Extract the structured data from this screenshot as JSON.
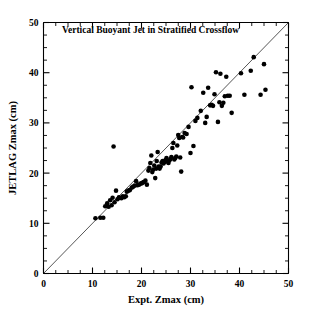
{
  "chart_data": {
    "type": "scatter",
    "title": "Vertical Buoyant Jet in Stratified Crossflow",
    "xlabel": "Expt. Zmax (cm)",
    "ylabel": "JETLAG Zmax (cm)",
    "xlim": [
      0,
      50
    ],
    "ylim": [
      0,
      50
    ],
    "xticks": [
      0,
      10,
      20,
      30,
      40,
      50
    ],
    "yticks": [
      0,
      10,
      20,
      30,
      40,
      50
    ],
    "xtick_labels": [
      "0",
      "10",
      "20",
      "30",
      "40",
      "50"
    ],
    "ytick_labels": [
      "0",
      "10",
      "20",
      "30",
      "40",
      "50"
    ],
    "minor_tick_interval": 2.5,
    "grid": false,
    "legend": false,
    "marker": "filled-circle",
    "marker_color": "#000000",
    "marker_size_px": 4.6,
    "reference_line": {
      "name": "one-to-one line",
      "x": [
        0,
        50
      ],
      "y": [
        0,
        50
      ],
      "color": "#2b2b2b"
    },
    "points": [
      [
        10.6,
        11.0
      ],
      [
        11.6,
        11.1
      ],
      [
        12.2,
        11.1
      ],
      [
        12.6,
        13.4
      ],
      [
        13.0,
        14.0
      ],
      [
        13.3,
        13.3
      ],
      [
        13.6,
        14.6
      ],
      [
        13.9,
        13.6
      ],
      [
        14.1,
        15.1
      ],
      [
        14.3,
        25.3
      ],
      [
        14.5,
        14.2
      ],
      [
        14.8,
        16.5
      ],
      [
        15.1,
        14.8
      ],
      [
        15.4,
        15.2
      ],
      [
        15.6,
        15.1
      ],
      [
        15.9,
        15.0
      ],
      [
        16.2,
        15.4
      ],
      [
        16.5,
        15.2
      ],
      [
        16.8,
        15.4
      ],
      [
        17.0,
        16.3
      ],
      [
        17.3,
        16.5
      ],
      [
        17.6,
        16.6
      ],
      [
        18.0,
        17.1
      ],
      [
        18.3,
        17.3
      ],
      [
        18.6,
        17.5
      ],
      [
        18.9,
        18.4
      ],
      [
        19.2,
        17.6
      ],
      [
        19.5,
        17.7
      ],
      [
        19.8,
        17.9
      ],
      [
        20.1,
        18.0
      ],
      [
        20.4,
        18.2
      ],
      [
        20.8,
        18.5
      ],
      [
        21.1,
        17.7
      ],
      [
        21.4,
        20.5
      ],
      [
        21.6,
        21.0
      ],
      [
        21.8,
        22.0
      ],
      [
        22.0,
        23.5
      ],
      [
        22.2,
        20.2
      ],
      [
        22.4,
        20.7
      ],
      [
        22.6,
        21.5
      ],
      [
        22.8,
        19.0
      ],
      [
        23.0,
        20.9
      ],
      [
        23.1,
        22.4
      ],
      [
        23.3,
        24.2
      ],
      [
        23.5,
        21.3
      ],
      [
        23.7,
        20.9
      ],
      [
        23.9,
        21.3
      ],
      [
        24.1,
        22.1
      ],
      [
        24.3,
        22.4
      ],
      [
        24.5,
        21.9
      ],
      [
        24.7,
        22.2
      ],
      [
        24.9,
        22.6
      ],
      [
        25.1,
        23.0
      ],
      [
        25.3,
        22.3
      ],
      [
        25.5,
        22.0
      ],
      [
        25.7,
        22.5
      ],
      [
        25.9,
        22.8
      ],
      [
        26.1,
        23.2
      ],
      [
        26.3,
        25.0
      ],
      [
        26.5,
        26.0
      ],
      [
        26.7,
        22.7
      ],
      [
        26.9,
        23.0
      ],
      [
        27.1,
        23.3
      ],
      [
        27.3,
        25.5
      ],
      [
        27.5,
        27.6
      ],
      [
        27.7,
        27.0
      ],
      [
        27.9,
        23.1
      ],
      [
        28.1,
        20.3
      ],
      [
        28.3,
        27.2
      ],
      [
        28.5,
        27.1
      ],
      [
        28.8,
        28.0
      ],
      [
        29.2,
        27.8
      ],
      [
        29.6,
        29.2
      ],
      [
        30.0,
        24.0
      ],
      [
        30.2,
        37.1
      ],
      [
        30.6,
        25.4
      ],
      [
        31.0,
        30.4
      ],
      [
        31.4,
        31.0
      ],
      [
        32.1,
        32.4
      ],
      [
        32.6,
        36.0
      ],
      [
        33.0,
        30.0
      ],
      [
        33.3,
        31.2
      ],
      [
        33.6,
        37.0
      ],
      [
        34.0,
        33.5
      ],
      [
        34.3,
        33.6
      ],
      [
        34.6,
        33.4
      ],
      [
        34.9,
        35.7
      ],
      [
        35.2,
        40.1
      ],
      [
        35.6,
        30.2
      ],
      [
        35.9,
        34.1
      ],
      [
        36.1,
        39.8
      ],
      [
        36.4,
        33.4
      ],
      [
        36.7,
        34.0
      ],
      [
        37.0,
        35.3
      ],
      [
        37.3,
        39.2
      ],
      [
        37.6,
        35.4
      ],
      [
        38.0,
        35.4
      ],
      [
        38.4,
        32.0
      ],
      [
        40.3,
        39.9
      ],
      [
        41.0,
        35.6
      ],
      [
        42.3,
        40.4
      ],
      [
        42.9,
        43.1
      ],
      [
        44.3,
        35.6
      ],
      [
        45.0,
        41.7
      ],
      [
        45.3,
        36.6
      ]
    ]
  }
}
